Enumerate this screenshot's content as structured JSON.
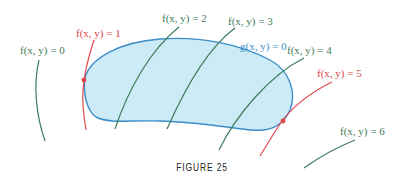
{
  "figure": {
    "caption": "FIGURE 25",
    "colors": {
      "level_curve": "#3f7d5a",
      "tangent_level_curve": "#e0474c",
      "constraint_curve": "#3c8ec9",
      "region_fill": "#cdeaf7"
    },
    "constraint": {
      "label": "g(x, y) = 0"
    },
    "level_curves": [
      {
        "label": "f(x, y) = 0",
        "value": 0,
        "color": "green"
      },
      {
        "label": "f(x, y) = 1",
        "value": 1,
        "color": "red",
        "tangent": true
      },
      {
        "label": "f(x, y) = 2",
        "value": 2,
        "color": "green"
      },
      {
        "label": "f(x, y) = 3",
        "value": 3,
        "color": "green"
      },
      {
        "label": "f(x, y) = 4",
        "value": 4,
        "color": "green"
      },
      {
        "label": "f(x, y) = 5",
        "value": 5,
        "color": "red",
        "tangent": true
      },
      {
        "label": "f(x, y) = 6",
        "value": 6,
        "color": "green"
      }
    ]
  }
}
